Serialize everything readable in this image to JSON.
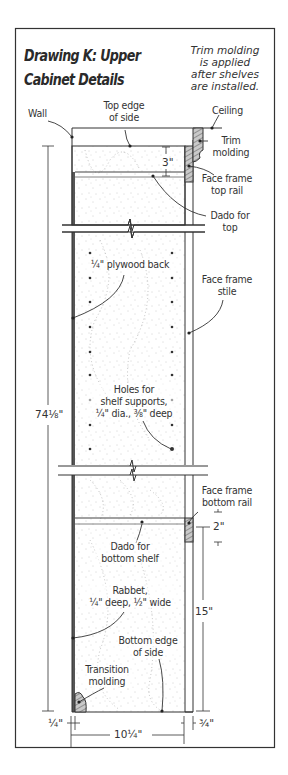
{
  "drawing": {
    "title": "Drawing K: Upper\nCabinet Details",
    "note": "Trim molding\nis applied\nafter shelves\nare installed."
  },
  "labels": {
    "wall": "Wall",
    "top_edge_of_side": "Top edge\nof side",
    "ceiling": "Ceiling",
    "trim_molding": "Trim\nmolding",
    "face_frame_top_rail": "Face frame\ntop rail",
    "dado_for_top": "Dado for\ntop",
    "plywood_back": "¼\" plywood back",
    "face_frame_stile": "Face frame\nstile",
    "holes_for_shelf_supports": "Holes for\nshelf supports,\n¼\" dia., ⅜\" deep",
    "face_frame_bottom_rail": "Face frame\nbottom rail",
    "dado_for_bottom_shelf": "Dado for\nbottom shelf",
    "rabbet": "Rabbet,\n¼\" deep, ½\" wide",
    "bottom_edge_of_side": "Bottom edge\nof side",
    "transition_molding": "Transition\nmolding"
  },
  "dimensions": {
    "top_rail_height": "3\"",
    "overall_height": "74⅛\"",
    "bottom_rail_height": "2\"",
    "bottom_rail_from_bottom": "15\"",
    "back_thickness": "¼\"",
    "depth": "10¼\"",
    "face_frame_thickness": "¾\""
  }
}
